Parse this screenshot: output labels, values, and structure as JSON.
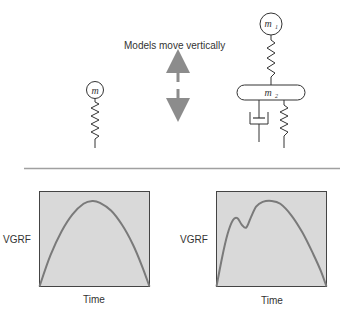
{
  "diagram": {
    "caption": "Models move vertically",
    "single_mass_model": {
      "mass_label": "m"
    },
    "two_mass_model": {
      "upper_mass_label": "m",
      "upper_mass_subscript": "1",
      "lower_mass_label": "m",
      "lower_mass_subscript": "2"
    },
    "arrow_color": "#8c8c8c",
    "line_color": "#333333",
    "divider_color": "#a0a0a0"
  },
  "chart_data": [
    {
      "type": "line",
      "title": "",
      "xlabel": "Time",
      "ylabel": "VGRF",
      "xlim": [
        0,
        1
      ],
      "ylim": [
        0,
        1
      ],
      "grid": false,
      "background": "#d9d9d9",
      "line_color": "#7a7a7a",
      "series": [
        {
          "name": "single-mass VGRF",
          "x": [
            0,
            0.1,
            0.2,
            0.3,
            0.4,
            0.48,
            0.55,
            0.65,
            0.75,
            0.85,
            0.93,
            1.0
          ],
          "y": [
            0,
            0.33,
            0.58,
            0.76,
            0.87,
            0.9,
            0.88,
            0.8,
            0.65,
            0.44,
            0.22,
            0
          ]
        }
      ]
    },
    {
      "type": "line",
      "title": "",
      "xlabel": "Time",
      "ylabel": "VGRF",
      "xlim": [
        0,
        1
      ],
      "ylim": [
        0,
        1
      ],
      "grid": false,
      "background": "#d9d9d9",
      "line_color": "#7a7a7a",
      "series": [
        {
          "name": "two-mass VGRF",
          "x": [
            0,
            0.05,
            0.1,
            0.15,
            0.19,
            0.23,
            0.27,
            0.31,
            0.36,
            0.42,
            0.5,
            0.58,
            0.68,
            0.78,
            0.88,
            0.95,
            1.0
          ],
          "y": [
            0,
            0.3,
            0.55,
            0.7,
            0.72,
            0.65,
            0.62,
            0.72,
            0.84,
            0.89,
            0.9,
            0.87,
            0.75,
            0.57,
            0.34,
            0.16,
            0
          ]
        }
      ]
    }
  ]
}
